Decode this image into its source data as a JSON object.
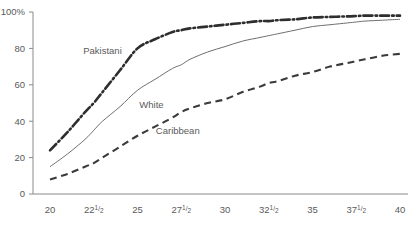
{
  "chart_data": {
    "type": "line",
    "title": "",
    "subtitle": "",
    "xlabel": "",
    "ylabel": "",
    "xlim": [
      20,
      40
    ],
    "ylim": [
      0,
      100
    ],
    "grid": false,
    "legend_position": "inline-annotations",
    "x_ticks": [
      {
        "value": 20,
        "label": "20",
        "sup": "",
        "sub": ""
      },
      {
        "value": 22.5,
        "label": "22",
        "sup": "1",
        "sub": "2"
      },
      {
        "value": 25,
        "label": "25",
        "sup": "",
        "sub": ""
      },
      {
        "value": 27.5,
        "label": "27",
        "sup": "1",
        "sub": "2"
      },
      {
        "value": 30,
        "label": "30",
        "sup": "",
        "sub": ""
      },
      {
        "value": 32.5,
        "label": "32",
        "sup": "1",
        "sub": "2"
      },
      {
        "value": 35,
        "label": "35",
        "sup": "",
        "sub": ""
      },
      {
        "value": 37.5,
        "label": "37",
        "sup": "1",
        "sub": "2"
      },
      {
        "value": 40,
        "label": "40",
        "sup": "",
        "sub": ""
      }
    ],
    "y_ticks": [
      {
        "value": 0,
        "label": "0"
      },
      {
        "value": 20,
        "label": "20"
      },
      {
        "value": 40,
        "label": "40"
      },
      {
        "value": 60,
        "label": "60"
      },
      {
        "value": 80,
        "label": "80"
      },
      {
        "value": 100,
        "label": "100%"
      }
    ],
    "x": [
      20,
      21,
      22,
      22.5,
      23,
      24,
      25,
      26,
      27,
      27.5,
      28,
      29,
      30,
      31,
      32,
      32.5,
      33,
      34,
      35,
      36,
      37,
      37.5,
      38,
      39,
      40
    ],
    "series": [
      {
        "name": "Pakistani",
        "style": "dash-dot",
        "color": "#2e2e2e",
        "label_x": 23.0,
        "label_y": 77,
        "values": [
          24,
          34,
          45,
          50,
          56,
          68,
          80,
          85,
          89,
          90,
          91,
          92,
          93,
          94,
          95,
          95,
          95.5,
          96,
          97,
          97.3,
          97.6,
          97.8,
          98,
          98,
          98
        ]
      },
      {
        "name": "White",
        "style": "solid",
        "color": "#6e6e6e",
        "label_x": 25.8,
        "label_y": 47,
        "values": [
          15,
          22,
          30,
          35,
          40,
          48,
          57,
          63,
          69,
          71,
          74,
          78,
          81,
          84,
          86,
          87,
          88,
          90,
          92,
          93,
          94,
          94.5,
          95,
          95.5,
          96
        ]
      },
      {
        "name": "Caribbean",
        "style": "dashed",
        "color": "#3a3a3a",
        "label_x": 27.3,
        "label_y": 33,
        "values": [
          8,
          11,
          15,
          17,
          20,
          26,
          32,
          37,
          42,
          45,
          47,
          50,
          52,
          56,
          59,
          61,
          62,
          65,
          67,
          70,
          72,
          73,
          74,
          76,
          77
        ]
      }
    ]
  }
}
